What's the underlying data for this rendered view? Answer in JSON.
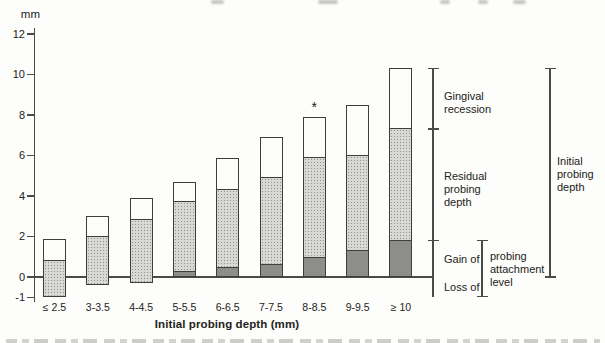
{
  "figure": {
    "y_unit_label": "mm",
    "x_axis_title": "Initial probing depth (mm)"
  },
  "chart_data": {
    "type": "bar",
    "stacked": true,
    "title": "",
    "xlabel": "Initial probing depth (mm)",
    "ylabel": "mm",
    "ylim": [
      -1.5,
      12.5
    ],
    "yticks": [
      12,
      10,
      8,
      6,
      4,
      2,
      0,
      -1
    ],
    "grid": false,
    "legend_position": "right-brackets",
    "categories": [
      "≤ 2.5",
      "3-3.5",
      "4-4.5",
      "5-5.5",
      "6-6.5",
      "7-7.5",
      "8-8.5",
      "9-9.5",
      "≥ 10"
    ],
    "segment_meanings": {
      "white": "Gingival recession",
      "light_stipple": "Residual probing depth (extends below baseline as loss of attachment)",
      "dark": "Gain of probing attachment"
    },
    "bars": [
      {
        "category": "≤ 2.5",
        "bottom": -1.0,
        "dark_top": null,
        "light_top": 0.8,
        "top": 1.9,
        "marker": ""
      },
      {
        "category": "3-3.5",
        "bottom": -0.4,
        "dark_top": null,
        "light_top": 2.0,
        "top": 3.0,
        "marker": ""
      },
      {
        "category": "4-4.5",
        "bottom": -0.3,
        "dark_top": null,
        "light_top": 2.8,
        "top": 3.9,
        "marker": ""
      },
      {
        "category": "5-5.5",
        "bottom": 0,
        "dark_top": 0.25,
        "light_top": 3.7,
        "top": 4.7,
        "marker": ""
      },
      {
        "category": "6-6.5",
        "bottom": 0,
        "dark_top": 0.45,
        "light_top": 4.3,
        "top": 5.9,
        "marker": ""
      },
      {
        "category": "7-7.5",
        "bottom": 0,
        "dark_top": 0.6,
        "light_top": 4.9,
        "top": 6.9,
        "marker": ""
      },
      {
        "category": "8-8.5",
        "bottom": 0,
        "dark_top": 0.95,
        "light_top": 5.9,
        "top": 7.9,
        "marker": "*"
      },
      {
        "category": "9-9.5",
        "bottom": 0,
        "dark_top": 1.3,
        "light_top": 6.0,
        "top": 8.5,
        "marker": ""
      },
      {
        "category": "≥ 10",
        "bottom": 0,
        "dark_top": 1.8,
        "light_top": 7.3,
        "top": 10.3,
        "marker": ""
      }
    ],
    "annotations": {
      "outcome_bracket": {
        "from": 10.3,
        "to": -1.0,
        "ticks": [
          7.3,
          1.8
        ],
        "labels": [
          {
            "text": "Gingival recession",
            "from": 10.3,
            "to": 7.3
          },
          {
            "text": "Residual probing depth",
            "from": 7.3,
            "to": 1.8
          },
          {
            "text": "Gain of",
            "from": 1.8,
            "to": 0
          },
          {
            "text": "Loss of",
            "from": 0,
            "to": -1.0
          }
        ]
      },
      "attachment_bracket": {
        "text": "probing attachment level",
        "from": 1.8,
        "to": -0.95
      },
      "initial_depth_bracket": {
        "text": "Initial probing depth",
        "from": 10.3,
        "to": 0
      }
    },
    "colors": {
      "bar_white": "#fdfdfc",
      "bar_light": "#d8d8d5",
      "bar_light_dot": "#90908d",
      "bar_dark": "#8d8d8a",
      "bar_border": "#3e3e3c",
      "axis": "#4a4a48",
      "text": "#232320"
    }
  }
}
